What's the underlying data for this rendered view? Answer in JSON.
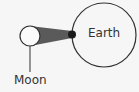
{
  "diagram": {
    "earth": {
      "label": "Earth"
    },
    "moon": {
      "label": "Moon"
    },
    "colors": {
      "stroke": "#333333",
      "shadow": "#555555",
      "background": "#f6f6f6"
    }
  }
}
